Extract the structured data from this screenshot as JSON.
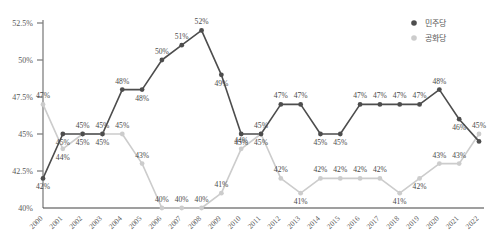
{
  "chart_data": {
    "type": "line",
    "title": "",
    "xlabel": "",
    "ylabel": "",
    "ylim": [
      40,
      52.5
    ],
    "yticks": [
      "40%",
      "42.5%",
      "45%",
      "47.5%",
      "50%",
      "52.5%"
    ],
    "ytick_values": [
      40,
      42.5,
      45,
      47.5,
      50,
      52.5
    ],
    "grid": false,
    "legend_position": "top-right",
    "categories": [
      "2000",
      "2001",
      "2002",
      "2003",
      "2004",
      "2005",
      "2006",
      "2007",
      "2008",
      "2009",
      "2010",
      "2011",
      "2012",
      "2013",
      "2014",
      "2015",
      "2016",
      "2017",
      "2018",
      "2019",
      "2020",
      "2021",
      "2022"
    ],
    "series": [
      {
        "name": "민주당",
        "color": "#4d4d4d",
        "marker": "circle",
        "values": [
          42,
          45,
          45,
          45,
          48,
          48,
          50,
          51,
          52,
          49,
          45,
          45,
          47,
          47,
          45,
          45,
          47,
          47,
          47,
          47,
          48,
          46,
          44.5
        ],
        "labels": [
          "42%",
          "45%",
          "45%",
          "45%",
          "48%",
          "48%",
          "50%",
          "51%",
          "52%",
          "49%",
          "45%",
          "45%",
          "47%",
          "47%",
          "45%",
          "45%",
          "47%",
          "47%",
          "47%",
          "47%",
          "48%",
          "46%",
          ""
        ],
        "label_pos": [
          "below",
          "below",
          "below",
          "below",
          "above",
          "below",
          "above",
          "above",
          "above",
          "below",
          "below",
          "below",
          "above",
          "above",
          "below",
          "below",
          "above",
          "above",
          "above",
          "above",
          "above",
          "below",
          "below"
        ]
      },
      {
        "name": "공화당",
        "color": "#cccccc",
        "marker": "circle",
        "values": [
          47,
          44,
          45,
          45,
          45,
          43,
          40,
          40,
          40,
          41,
          44,
          45,
          42,
          41,
          42,
          42,
          42,
          42,
          41,
          42,
          43,
          43,
          45
        ],
        "labels": [
          "47%",
          "44%",
          "45%",
          "45%",
          "45%",
          "43%",
          "40%",
          "40%",
          "40%",
          "41%",
          "44%",
          "45%",
          "42%",
          "41%",
          "42%",
          "42%",
          "42%",
          "42%",
          "41%",
          "42%",
          "43%",
          "43%",
          "45%"
        ],
        "label_pos": [
          "above",
          "below",
          "above",
          "above",
          "above",
          "above",
          "above",
          "above",
          "above",
          "above",
          "above",
          "above",
          "above",
          "below",
          "above",
          "above",
          "above",
          "above",
          "below",
          "below",
          "above",
          "above",
          "above"
        ]
      }
    ]
  },
  "legend": {
    "items": [
      {
        "label": "민주당",
        "color": "#4d4d4d"
      },
      {
        "label": "공화당",
        "color": "#cccccc"
      }
    ]
  },
  "axis": {
    "y_axis_color": "#808080",
    "x_axis_color": "#404040"
  }
}
